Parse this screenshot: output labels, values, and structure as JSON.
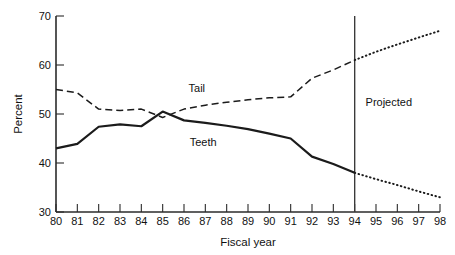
{
  "chart_data": {
    "type": "line",
    "title": "",
    "xlabel": "Fiscal year",
    "ylabel": "Percent",
    "xlim": [
      80,
      98
    ],
    "ylim": [
      30,
      70
    ],
    "grid": false,
    "legend_position": "inline-annotation",
    "x": [
      80,
      81,
      82,
      83,
      84,
      85,
      86,
      87,
      88,
      89,
      90,
      91,
      92,
      93,
      94,
      95,
      96,
      97,
      98
    ],
    "xticklabels": [
      "80",
      "81",
      "82",
      "83",
      "84",
      "85",
      "86",
      "87",
      "88",
      "89",
      "90",
      "91",
      "92",
      "93",
      "94",
      "95",
      "96",
      "97",
      "98"
    ],
    "yticks": [
      30,
      40,
      50,
      60,
      70
    ],
    "yticklabels": [
      "30",
      "40",
      "50",
      "60",
      "70"
    ],
    "series": [
      {
        "name": "Tail",
        "style_actual": "dashed",
        "style_projected": "dotted",
        "values": [
          55.0,
          54.3,
          51.0,
          50.7,
          51.0,
          49.3,
          51.0,
          51.8,
          52.4,
          52.9,
          53.3,
          53.5,
          57.3,
          59.0,
          61.0,
          62.7,
          64.2,
          65.6,
          67.0
        ]
      },
      {
        "name": "Teeth",
        "style_actual": "solid",
        "style_projected": "dotted",
        "values": [
          43.0,
          43.9,
          47.4,
          47.9,
          47.5,
          50.5,
          48.7,
          48.2,
          47.6,
          46.9,
          46.0,
          45.0,
          41.3,
          39.8,
          38.0,
          36.7,
          35.5,
          34.2,
          33.0
        ]
      }
    ],
    "projection_start_x": 94,
    "annotations": [
      {
        "name": "tail-series-label",
        "text": "Tail",
        "x": 86.6,
        "y": 55.3
      },
      {
        "name": "teeth-series-label",
        "text": "Teeth",
        "x": 86.9,
        "y": 44.2
      },
      {
        "name": "projected-region-label",
        "text": "Projected",
        "x": 95.6,
        "y": 52.4
      }
    ],
    "divider": {
      "name": "projection-divider",
      "x": 94
    }
  },
  "axes": {
    "y_title": "Percent",
    "x_title": "Fiscal year"
  }
}
